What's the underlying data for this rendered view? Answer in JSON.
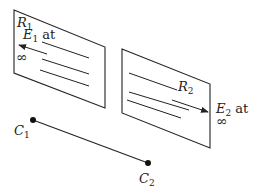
{
  "diagram": {
    "regions": [
      {
        "id": "R1",
        "label": "R",
        "label_sub": "1",
        "field_label": "E",
        "field_sub": "1",
        "field_suffix": "at",
        "infinity": "∞",
        "arrow_direction": "left"
      },
      {
        "id": "R2",
        "label": "R",
        "label_sub": "2",
        "field_label": "E",
        "field_sub": "2",
        "field_suffix": "at",
        "infinity": "∞",
        "arrow_direction": "right"
      }
    ],
    "points": [
      {
        "id": "C1",
        "label": "C",
        "label_sub": "1"
      },
      {
        "id": "C2",
        "label": "C",
        "label_sub": "2"
      }
    ],
    "colors": {
      "stroke": "#222222",
      "background": "#ffffff"
    }
  }
}
